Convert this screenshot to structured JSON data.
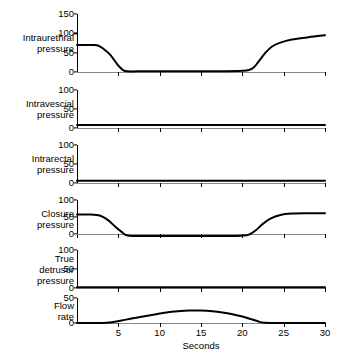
{
  "figure": {
    "background": "#ffffff",
    "line_color": "#000000",
    "x_axis_title": "Seconds"
  },
  "chart_data": {
    "type": "line",
    "title": "",
    "subtitle": "",
    "xlabel": "Seconds",
    "ylabel": "",
    "xlim": [
      0,
      30
    ],
    "x_ticks": [
      0,
      5,
      10,
      15,
      20,
      25,
      30
    ],
    "x_tick_labels": [
      "",
      "5",
      "10",
      "15",
      "20",
      "25",
      "30"
    ],
    "grid": false,
    "legend": "none",
    "shared_x_axis": true,
    "panels": [
      {
        "name": "intraurethral-pressure",
        "label": "Intraurethral\npressure",
        "ylim": [
          0,
          150
        ],
        "y_ticks": [
          0,
          50,
          100,
          150
        ],
        "y_tick_labels": [
          "0",
          "50",
          "100",
          "150"
        ],
        "series_name": "Intraurethral pressure",
        "x": [
          0,
          1,
          2,
          2.6,
          3.2,
          4,
          4.8,
          5.4,
          6,
          8,
          10,
          14,
          18,
          20,
          20.8,
          21.4,
          22,
          22.8,
          23.6,
          24.6,
          26,
          28,
          30
        ],
        "y": [
          70,
          70,
          70,
          68,
          60,
          45,
          22,
          8,
          2,
          2,
          2,
          2,
          2,
          3,
          5,
          12,
          28,
          50,
          66,
          76,
          84,
          90,
          95
        ]
      },
      {
        "name": "intravesical-pressure",
        "label": "Intravescial\npressure",
        "ylim": [
          0,
          100
        ],
        "y_ticks": [
          0,
          50,
          100
        ],
        "y_tick_labels": [
          "0",
          "50",
          "100"
        ],
        "series_name": "Intravescial pressure",
        "x": [
          0,
          5,
          10,
          15,
          20,
          25,
          30
        ],
        "y": [
          8,
          8,
          8,
          8,
          8,
          8,
          8
        ]
      },
      {
        "name": "intrarectal-pressure",
        "label": "Intrarectal\npressure",
        "ylim": [
          0,
          100
        ],
        "y_ticks": [
          0,
          50,
          100
        ],
        "y_tick_labels": [
          "0",
          "50",
          "100"
        ],
        "series_name": "Intrarectal pressure",
        "x": [
          0,
          5,
          10,
          15,
          20,
          25,
          30
        ],
        "y": [
          6,
          6,
          6,
          6,
          6,
          6,
          6
        ]
      },
      {
        "name": "closure-pressure",
        "label": "Closure\npressure",
        "ylim": [
          -12,
          100
        ],
        "y_ticks": [
          0,
          50,
          100
        ],
        "y_tick_labels": [
          "0",
          "50",
          "100"
        ],
        "series_name": "Closure pressure",
        "x": [
          0,
          1.5,
          2.4,
          3,
          3.8,
          4.6,
          5.4,
          6,
          7,
          10,
          14,
          18,
          20,
          20.8,
          21.6,
          22.4,
          23.4,
          24.6,
          26,
          28,
          30
        ],
        "y": [
          57,
          57,
          56,
          52,
          40,
          22,
          6,
          -4,
          -6,
          -6,
          -6,
          -6,
          -5,
          -2,
          10,
          28,
          45,
          56,
          60,
          61,
          61
        ]
      },
      {
        "name": "true-detrusor-pressure",
        "label": "True\ndetrusor\npressure",
        "ylim": [
          0,
          100
        ],
        "y_ticks": [
          0,
          50,
          100
        ],
        "y_tick_labels": [
          "0",
          "50",
          "100"
        ],
        "series_name": "True detrusor pressure",
        "x": [
          0,
          5,
          10,
          15,
          20,
          25,
          30
        ],
        "y": [
          2,
          2,
          2,
          2,
          2,
          2,
          2
        ]
      },
      {
        "name": "flow-rate",
        "label": "Flow\nrate",
        "ylim": [
          0,
          50
        ],
        "y_ticks": [
          0,
          50
        ],
        "y_tick_labels": [
          "0",
          "50"
        ],
        "series_name": "Flow rate",
        "x": [
          0,
          2,
          3.6,
          4.4,
          5.4,
          6.6,
          8,
          9.4,
          10.8,
          12.2,
          13.6,
          15,
          16.4,
          17.6,
          18.8,
          20,
          21,
          21.8,
          22.4,
          24,
          27,
          30
        ],
        "y": [
          0,
          0,
          0.5,
          2,
          5,
          9,
          13,
          17,
          21,
          23.5,
          25,
          25,
          23.5,
          21,
          17.5,
          13,
          8,
          4,
          1,
          0,
          0,
          0
        ]
      }
    ]
  }
}
